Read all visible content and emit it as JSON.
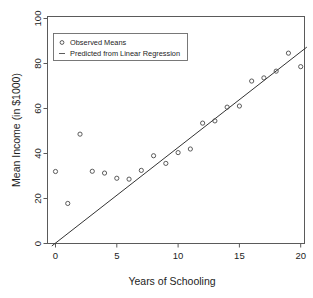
{
  "chart_data": {
    "type": "scatter",
    "title": "",
    "xlabel": "Years of Schooling",
    "ylabel": "Mean Income (in $1000)",
    "xlim": [
      -1,
      21
    ],
    "ylim": [
      -4,
      104
    ],
    "xticks": [
      0,
      5,
      10,
      15,
      20
    ],
    "yticks": [
      0,
      20,
      40,
      60,
      80,
      100
    ],
    "xtick_labels": [
      "0",
      "5",
      "10",
      "15",
      "20"
    ],
    "ytick_labels": [
      "0",
      "20",
      "40",
      "60",
      "80",
      "100"
    ],
    "grid": false,
    "legend_position": "top-left",
    "legend": [
      {
        "marker": "circle",
        "label": "Observed Means"
      },
      {
        "marker": "line",
        "label": "Predicted from Linear Regression"
      }
    ],
    "series": [
      {
        "name": "Observed Means",
        "type": "scatter",
        "marker": "open-circle",
        "x": [
          0,
          1,
          2,
          3,
          4,
          5,
          6,
          7,
          8,
          9,
          10,
          11,
          12,
          13,
          14,
          15,
          16,
          17,
          18,
          19,
          20
        ],
        "y": [
          32.0,
          17.8,
          48.6,
          32.1,
          31.3,
          29.0,
          28.6,
          32.5,
          39.0,
          35.6,
          40.4,
          42.0,
          53.5,
          54.5,
          60.6,
          61.1,
          72.2,
          73.6,
          76.6,
          84.6,
          78.6
        ]
      },
      {
        "name": "Predicted from Linear Regression",
        "type": "line",
        "slope": 4.25,
        "intercept": 0.2,
        "x": [
          -0.3,
          20.5
        ],
        "y": [
          -1.1,
          87.3
        ]
      }
    ]
  },
  "axes": {
    "x_title": "Years of Schooling",
    "y_title": "Mean Income (in $1000)"
  },
  "legend": {
    "items": [
      {
        "label": "Observed Means"
      },
      {
        "label": "Predicted from Linear Regression"
      }
    ]
  },
  "colors": {
    "frame": "#5a5a5a",
    "point": "#4a4a4a",
    "line": "#333333",
    "text": "#1d1d1d",
    "background": "#ffffff"
  }
}
